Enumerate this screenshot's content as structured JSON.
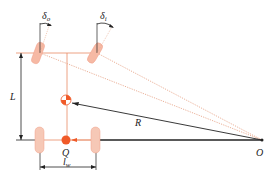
{
  "diagram": {
    "type": "vehicle steering geometry (Ackermann)",
    "labels": {
      "delta_o": "δ",
      "delta_o_sub": "o",
      "delta_i": "δ",
      "delta_i_sub": "i",
      "wheelbase": "L",
      "radius": "R",
      "point_q": "Q",
      "center_o": "O",
      "track": "l",
      "track_sub": "w"
    },
    "colors": {
      "wheel_fill": "#f6b9a4",
      "construction_line": "#e88a66",
      "dotted_line": "#e8a78c",
      "marker": "#f05a28",
      "dimension_line": "#222222"
    }
  }
}
